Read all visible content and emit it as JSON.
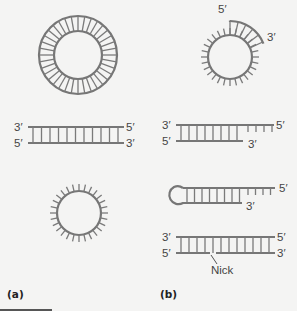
{
  "figure": {
    "panel_labels": {
      "a": "(a)",
      "b": "(b)"
    },
    "colors": {
      "strand": "#767676",
      "background": "#f4f4f3",
      "text": "#444444"
    },
    "panel_a": {
      "items": [
        {
          "name": "circular-double-stranded-dna",
          "labels": []
        },
        {
          "name": "linear-double-stranded-dna",
          "labels": {
            "top_left": "3′",
            "top_right": "5′",
            "bottom_left": "5′",
            "bottom_right": "3′"
          }
        },
        {
          "name": "circular-single-stranded-dna",
          "labels": []
        }
      ]
    },
    "panel_b": {
      "items": [
        {
          "name": "circle-with-partial-strand",
          "labels": {
            "start": "5′",
            "end": "3′"
          }
        },
        {
          "name": "partially-double-stranded-linear",
          "labels": {
            "top_left": "3′",
            "top_right": "5′",
            "bottom_left": "5′",
            "bottom_right": "3′"
          }
        },
        {
          "name": "hairpin",
          "labels": {
            "top_right": "5′",
            "bottom_right": "3′"
          }
        },
        {
          "name": "nicked-double-stranded",
          "labels": {
            "top_left": "3′",
            "top_right": "5′",
            "bottom_left": "5′",
            "bottom_right": "3′",
            "nick": "Nick"
          }
        }
      ]
    }
  }
}
